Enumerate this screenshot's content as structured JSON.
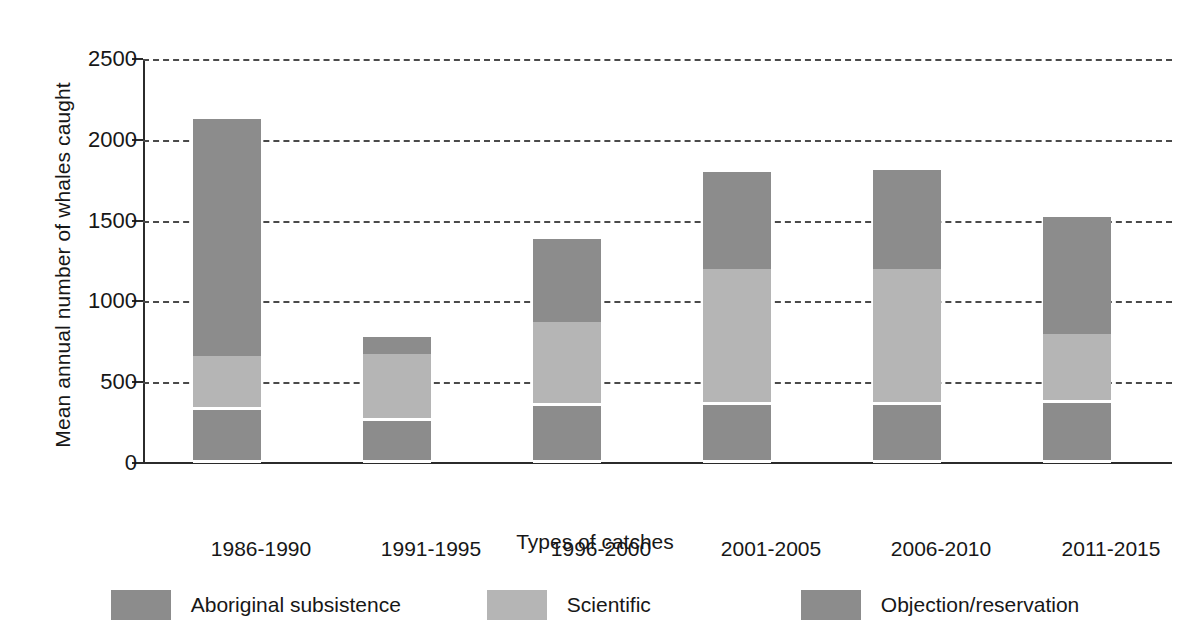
{
  "chart_data": {
    "type": "bar",
    "subtype": "stacked-vertical",
    "title": "",
    "xlabel": "Types of catches",
    "ylabel": "Mean annual number of whales caught",
    "categories": [
      "1986-1990",
      "1991-1995",
      "1996-2000",
      "2001-2005",
      "2006-2010",
      "2011-2015"
    ],
    "series": [
      {
        "name": "Aboriginal subsistence",
        "color": "#8c8c8c",
        "values": [
          330,
          260,
          350,
          360,
          360,
          370
        ]
      },
      {
        "name": "Scientific",
        "color": "#b5b5b5",
        "values": [
          330,
          415,
          520,
          840,
          840,
          430
        ]
      },
      {
        "name": "Objection/reservation",
        "color": "#8c8c8c",
        "values": [
          1470,
          105,
          515,
          600,
          615,
          720
        ]
      }
    ],
    "totals": [
      2130,
      780,
      1385,
      1800,
      1815,
      1520
    ],
    "ylim": [
      0,
      2500
    ],
    "yticks": [
      0,
      500,
      1000,
      1500,
      2000,
      2500
    ],
    "ytick_labels": [
      "0",
      "500",
      "1000",
      "1500",
      "2000",
      "2500"
    ],
    "grid": "horizontal-dashed",
    "legend_position": "bottom",
    "separator_color": "#ffffff",
    "axis_color": "#2b2b2b",
    "gridline_color": "#4a4a4a",
    "background": "#ffffff"
  }
}
